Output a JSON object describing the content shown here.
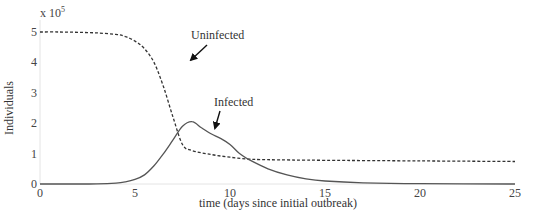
{
  "chart_data": {
    "type": "line",
    "title": "",
    "xlabel": "time (days since initial outbreak)",
    "ylabel": "Individuals",
    "y_multiplier": "x 10",
    "y_multiplier_exp": "5",
    "xlim": [
      0,
      25
    ],
    "ylim": [
      0,
      5
    ],
    "xticks": [
      0,
      5,
      10,
      15,
      20,
      25
    ],
    "yticks": [
      0,
      1,
      2,
      3,
      4,
      5
    ],
    "grid": false,
    "legend": "none (inline annotations with arrows)",
    "series": [
      {
        "name": "Uninfected",
        "style": "dashed",
        "color": "#333333",
        "x": [
          0,
          1,
          2,
          3,
          4,
          4.5,
          5,
          5.5,
          6,
          6.5,
          7,
          7.5,
          8,
          9,
          10,
          11,
          12,
          15,
          20,
          25
        ],
        "values": [
          5.0,
          5.0,
          4.99,
          4.97,
          4.92,
          4.85,
          4.7,
          4.45,
          4.0,
          3.2,
          2.2,
          1.3,
          1.1,
          0.97,
          0.88,
          0.82,
          0.8,
          0.78,
          0.76,
          0.74
        ]
      },
      {
        "name": "Infected",
        "style": "solid",
        "color": "#555555",
        "x": [
          0,
          2,
          3,
          4,
          4.5,
          5,
          5.5,
          6,
          6.5,
          7,
          7.5,
          8,
          8.5,
          9,
          9.5,
          10,
          10.5,
          11,
          12,
          13,
          14,
          15,
          17,
          20,
          25
        ],
        "values": [
          0,
          0,
          0.005,
          0.03,
          0.07,
          0.15,
          0.3,
          0.6,
          1.0,
          1.45,
          1.9,
          2.05,
          1.85,
          1.65,
          1.5,
          1.3,
          1.0,
          0.8,
          0.5,
          0.3,
          0.17,
          0.1,
          0.04,
          0.01,
          0.0
        ]
      }
    ],
    "annotations": [
      {
        "text": "Uninfected",
        "arrow_to": [
          6.2,
          3.8
        ]
      },
      {
        "text": "Infected",
        "arrow_to": [
          9.2,
          1.55
        ]
      }
    ]
  }
}
